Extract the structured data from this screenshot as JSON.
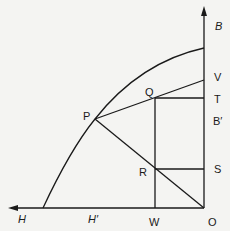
{
  "diagram": {
    "type": "geometric-construction",
    "stroke_color": "#1a1a1a",
    "background": "#f4f4f2",
    "axes": {
      "vertical": {
        "label": "B",
        "direction": "up"
      },
      "horizontal": {
        "label": "H",
        "direction": "left"
      },
      "origin": "O"
    },
    "points": {
      "O": "O",
      "P": "P",
      "Q": "Q",
      "R": "R",
      "V": "V",
      "T": "T",
      "B_prime": "B′",
      "S": "S",
      "W": "W",
      "H_prime": "H′",
      "B": "B",
      "H": "H"
    },
    "segments": [
      "P–V",
      "P–O",
      "Q–T",
      "Q–W",
      "R–S",
      "curve H′–P–B"
    ]
  }
}
